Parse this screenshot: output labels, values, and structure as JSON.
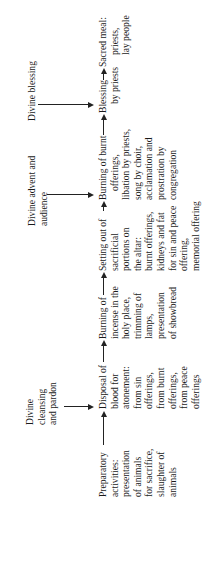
{
  "diagram": {
    "orientation": "rotated 90 degrees counter-clockwise",
    "main_flow": [
      {
        "id": "preparatory",
        "lines": [
          "Preparatory",
          "activities:",
          "presentation",
          "of animals",
          "for sacrifice,",
          "slaughter of",
          "animals"
        ]
      },
      {
        "id": "disposal",
        "lines": [
          "Disposal of",
          "blood for",
          "atonement:",
          "from sin",
          "offerings,",
          "from burnt",
          "offerings,",
          "from peace",
          "offerings"
        ]
      },
      {
        "id": "incense",
        "lines": [
          "Burning of",
          "incense in the",
          "holy place,",
          "trimming of",
          "lamps,",
          "presentation",
          "of showbread"
        ]
      },
      {
        "id": "setting-out",
        "lines": [
          "Setting out of",
          "sacrificial",
          "portions on",
          "the altar:",
          "burnt offerings,",
          "kidneys and fat",
          "for sin and peace",
          "offering,",
          "memorial offering"
        ]
      },
      {
        "id": "burnt-offerings",
        "lines": [
          "Burning of burnt",
          "offerings,",
          "libation by priests,",
          "song by choir,",
          "acclamation and",
          "prostration by",
          "congregation"
        ]
      },
      {
        "id": "blessing",
        "lines": [
          "Blessing",
          "by priests"
        ]
      },
      {
        "id": "sacred-meal",
        "lines": [
          "Sacred meal:",
          "priests,",
          "lay people"
        ]
      }
    ],
    "divine_inputs": [
      {
        "id": "divine-cleansing",
        "lines": [
          "Divine",
          "cleansing",
          "and pardon"
        ],
        "target": "disposal"
      },
      {
        "id": "divine-advent",
        "lines": [
          "Divine advent and",
          "audience"
        ],
        "target": "burnt-offerings"
      },
      {
        "id": "divine-blessing",
        "lines": [
          "Divine blessing"
        ],
        "target": "blessing"
      }
    ]
  }
}
